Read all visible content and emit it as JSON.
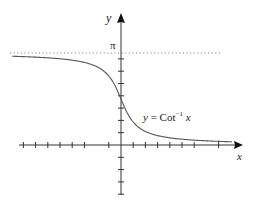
{
  "figure": {
    "x_axis_label": "x",
    "y_axis_label": "y",
    "pi_label": "π",
    "curve_label": {
      "lhs": "y",
      "eq": " = ",
      "func": "Cot",
      "exp": "−1",
      "arg": " x"
    },
    "colors": {
      "axis": "#222222",
      "curve": "#555555",
      "asymptote": "#888888",
      "background": "#ffffff"
    }
  },
  "chart_data": {
    "type": "line",
    "title": "",
    "function": "y = Cot^-1 x",
    "note": "Points are model values from arccot(x) = pi/2 - arctan(x), not measured from the image. The image shows only an unlabeled smooth curve.",
    "xlabel": "x",
    "ylabel": "y",
    "x_ticks_count_negative": 9,
    "x_ticks_count_positive": 9,
    "y_ticks_count_positive": 9,
    "y_ticks_count_negative": 4,
    "y_tick_labels": [
      "π"
    ],
    "asymptotes": [
      {
        "type": "horizontal",
        "y": "π",
        "style": "dotted"
      },
      {
        "type": "horizontal",
        "y": 0,
        "style": "coincides with x-axis"
      }
    ],
    "y_intercept": "π/2",
    "xlim": [
      -9,
      9.5
    ],
    "ylim": [
      -1.5,
      3.6
    ],
    "grid": false,
    "legend": "none",
    "series": [
      {
        "name": "y = Cot^-1 x",
        "x": [
          -9,
          -8,
          -7,
          -6,
          -5,
          -4,
          -3,
          -2,
          -1,
          -0.5,
          0,
          0.5,
          1,
          2,
          3,
          4,
          5,
          6,
          7,
          8,
          9
        ],
        "y": [
          3.031,
          3.017,
          3.0,
          2.976,
          2.944,
          2.897,
          2.82,
          2.678,
          2.356,
          2.034,
          1.571,
          1.107,
          0.785,
          0.464,
          0.322,
          0.245,
          0.197,
          0.165,
          0.142,
          0.124,
          0.111
        ]
      }
    ]
  }
}
